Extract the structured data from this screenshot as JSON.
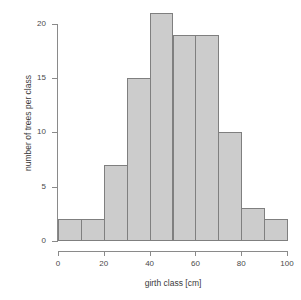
{
  "chart_data": {
    "type": "bar",
    "subtype": "histogram",
    "title": "",
    "xlabel": "girth class [cm]",
    "ylabel": "number of trees per class",
    "categories": [
      "0-10",
      "10-20",
      "20-30",
      "30-40",
      "40-50",
      "50-60",
      "60-70",
      "70-80",
      "80-90",
      "90-100"
    ],
    "bin_edges": [
      0,
      10,
      20,
      30,
      40,
      50,
      60,
      70,
      80,
      90,
      100
    ],
    "bin_width": 10,
    "values": [
      2,
      2,
      7,
      15,
      21,
      19,
      19,
      10,
      3,
      2
    ],
    "total_count": 100,
    "xlim": [
      0,
      100
    ],
    "ylim": [
      0,
      21
    ],
    "x_ticks": [
      0,
      20,
      40,
      60,
      80,
      100
    ],
    "x_tick_labels": [
      "0",
      "20",
      "40",
      "60",
      "80",
      "100"
    ],
    "y_ticks": [
      0,
      5,
      10,
      15,
      20
    ],
    "y_tick_labels": [
      "0",
      "5",
      "10",
      "15",
      "20"
    ],
    "grid": false,
    "legend": null,
    "bar_fill_color": "#cccccc",
    "bar_edge_color": "#7f7f7f",
    "axis_color": "#8a8a8a",
    "text_color": "#3a3a3a",
    "background_color": "#ffffff"
  }
}
